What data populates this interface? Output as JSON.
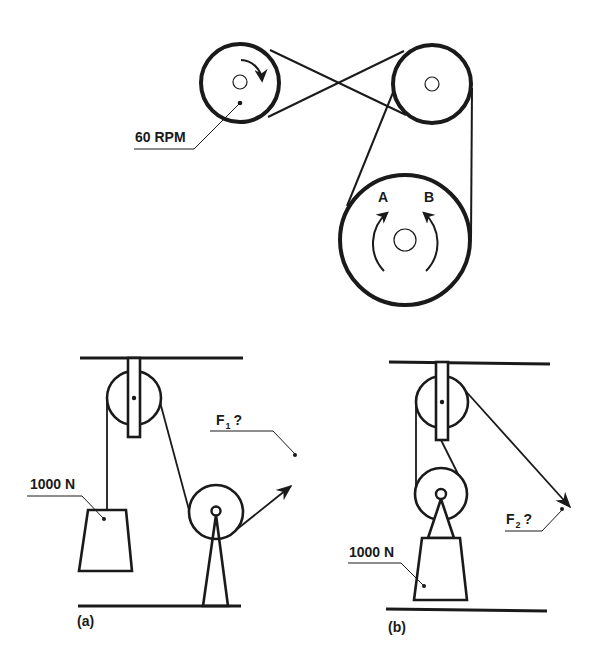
{
  "colors": {
    "ink": "#1a1a1a",
    "background": "#ffffff"
  },
  "belt_drive": {
    "driver_pulley": {
      "label": "60 RPM",
      "rotation": "clockwise"
    },
    "idler_pulley": {},
    "large_pulley": {
      "direction_options": [
        {
          "label": "A",
          "rotation": "clockwise"
        },
        {
          "label": "B",
          "rotation": "counterclockwise"
        }
      ]
    },
    "belt": "crossed between driver and idler; open between idler and large pulley"
  },
  "pulley_system_a": {
    "caption": "(a)",
    "load_label": "1000 N",
    "force": {
      "symbol": "F",
      "subscript": "1",
      "suffix": "?"
    },
    "force_direction": "up-right"
  },
  "pulley_system_b": {
    "caption": "(b)",
    "load_label": "1000 N",
    "force": {
      "symbol": "F",
      "subscript": "2",
      "suffix": "?"
    },
    "force_direction": "down-right"
  }
}
